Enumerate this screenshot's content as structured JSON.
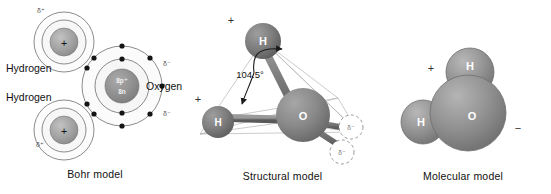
{
  "figure": {
    "background_color": "#ffffff"
  },
  "panels": {
    "bohr": {
      "caption": "Bohr model",
      "hydrogen_top": {
        "label": "Hydrogen",
        "nucleus_symbol": "+",
        "charge_label": "δ⁺"
      },
      "hydrogen_bottom": {
        "label": "Hydrogen",
        "nucleus_symbol": "+",
        "charge_label": "δ⁺"
      },
      "oxygen": {
        "label": "Oxygen",
        "protons": "8p⁺",
        "neutrons": "8n",
        "charge_label_upper": "δ⁻",
        "charge_label_lower": "δ⁻"
      }
    },
    "structural": {
      "caption": "Structural model",
      "bond_angle": "104.5°",
      "atoms": [
        {
          "symbol": "H",
          "charge": "+"
        },
        {
          "symbol": "H",
          "charge": "+"
        },
        {
          "symbol": "O",
          "charge": ""
        }
      ],
      "lone_pairs": [
        {
          "charge": "δ⁻"
        },
        {
          "charge": "δ⁻"
        }
      ]
    },
    "molecular": {
      "caption": "Molecular model",
      "atoms": [
        {
          "symbol": "H"
        },
        {
          "symbol": "H"
        },
        {
          "symbol": "O"
        }
      ],
      "charge_positive": "+",
      "charge_negative": "−"
    }
  },
  "colors": {
    "background": "#ffffff",
    "text": "#111111",
    "nucleus_gray": "#9a9a9a",
    "oxygen_nucleus_gray": "#8c8c8c",
    "shell_fill": "#fbfbfb",
    "shell_stroke": "#6b6b6b",
    "electron_dot": "#141414",
    "sphere_gray": "#8f8f8f",
    "sphere_light": "#a8a8a8",
    "bond_gray": "#777777"
  }
}
